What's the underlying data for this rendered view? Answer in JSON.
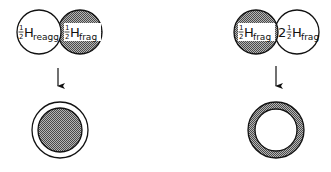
{
  "left_panel": {
    "top_left_circle": {
      "coef": "1/2",
      "base": "H",
      "sub": "reagg",
      "fill": "white"
    },
    "top_right_circle": {
      "coef": "1/2",
      "base": "H",
      "sub": "frag",
      "fill": "hatched"
    },
    "arrow": "down",
    "result": {
      "description": "white outer ring around hatched core",
      "outer_fill": "white",
      "inner_fill": "hatched"
    }
  },
  "right_panel": {
    "top_left_circle": {
      "coef": "1/2",
      "base": "H",
      "sub": "frag",
      "fill": "hatched"
    },
    "top_right_circle": {
      "whole": "2",
      "coef": "1/2",
      "base": "H",
      "sub": "frag",
      "fill": "white"
    },
    "arrow": "down",
    "result": {
      "description": "hatched outer ring around white core",
      "outer_fill": "hatched",
      "inner_fill": "white"
    }
  },
  "labels": {
    "l1_num": "1",
    "l1_den": "2",
    "l1_base": "H",
    "l1_sub": "reagg",
    "l2_num": "1",
    "l2_den": "2",
    "l2_base": "H",
    "l2_sub": "frag",
    "r1_num": "1",
    "r1_den": "2",
    "r1_base": "H",
    "r1_sub": "frag",
    "r2_whole": "2",
    "r2_num": "1",
    "r2_den": "2",
    "r2_base": "H",
    "r2_sub": "frag"
  },
  "colors": {
    "stroke": "#111111",
    "hatch_dark": "#555555",
    "hatch_light": "#bbbbbb",
    "background": "#ffffff"
  }
}
